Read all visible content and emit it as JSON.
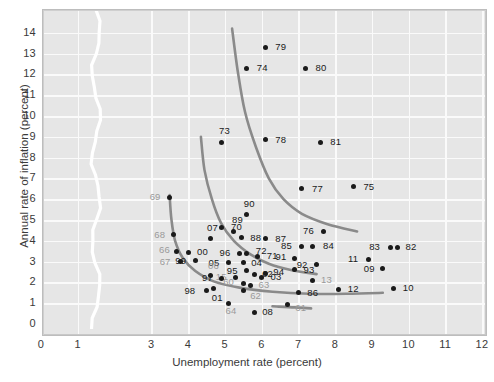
{
  "chart_data": {
    "type": "scatter",
    "title": "",
    "xlabel": "Unemployment rate (percent)",
    "ylabel": "Annual rate of inflation (percent)",
    "xlim": [
      0,
      12
    ],
    "ylim": [
      0,
      14
    ],
    "xticks": [
      0,
      1,
      3,
      4,
      5,
      6,
      7,
      8,
      9,
      10,
      11,
      12
    ],
    "yticks": [
      0,
      1,
      2,
      3,
      4,
      5,
      6,
      7,
      8,
      9,
      10,
      11,
      12,
      13,
      14
    ],
    "axis_break": {
      "between": [
        1,
        3
      ],
      "axis": "x"
    },
    "grid": true,
    "legend": "none",
    "point_color": "#1a1a1a",
    "curve_color": "#8a8a8a",
    "background_color": "#e6e6e6",
    "gridline_color": "#fafafa",
    "points": [
      {
        "label": "79",
        "x": 6.1,
        "y": 13.3,
        "lx": 10,
        "ly": -5,
        "faint": false
      },
      {
        "label": "74",
        "x": 5.6,
        "y": 12.3,
        "lx": 10,
        "ly": -5,
        "faint": false
      },
      {
        "label": "80",
        "x": 7.2,
        "y": 12.3,
        "lx": 10,
        "ly": -5,
        "faint": false
      },
      {
        "label": "73",
        "x": 4.9,
        "y": 8.75,
        "lx": -2,
        "ly": -16,
        "faint": false
      },
      {
        "label": "78",
        "x": 6.1,
        "y": 8.85,
        "lx": 10,
        "ly": -5,
        "faint": false
      },
      {
        "label": "81",
        "x": 7.6,
        "y": 8.75,
        "lx": 10,
        "ly": -5,
        "faint": false
      },
      {
        "label": "77",
        "x": 7.1,
        "y": 6.5,
        "lx": 10,
        "ly": -5,
        "faint": false
      },
      {
        "label": "75",
        "x": 8.5,
        "y": 6.6,
        "lx": 10,
        "ly": -5,
        "faint": false
      },
      {
        "label": "69",
        "x": 3.5,
        "y": 6.1,
        "lx": -20,
        "ly": -5,
        "faint": true
      },
      {
        "label": "90",
        "x": 5.6,
        "y": 5.25,
        "lx": -3,
        "ly": -16,
        "faint": false
      },
      {
        "label": "70",
        "x": 4.9,
        "y": 4.65,
        "lx": 10,
        "ly": -5,
        "faint": false
      },
      {
        "label": "76",
        "x": 7.7,
        "y": 4.45,
        "lx": -21,
        "ly": -5,
        "faint": false
      },
      {
        "label": "68",
        "x": 3.6,
        "y": 4.3,
        "lx": -19,
        "ly": -5,
        "faint": true
      },
      {
        "label": "07",
        "x": 4.6,
        "y": 4.1,
        "lx": -3,
        "ly": -16,
        "faint": false
      },
      {
        "label": "89",
        "x": 5.25,
        "y": 4.45,
        "lx": -2,
        "ly": -16,
        "faint": false
      },
      {
        "label": "88",
        "x": 5.45,
        "y": 4.15,
        "lx": 9,
        "ly": -5,
        "faint": false
      },
      {
        "label": "87",
        "x": 6.1,
        "y": 4.1,
        "lx": 10,
        "ly": -5,
        "faint": false
      },
      {
        "label": "85",
        "x": 7.1,
        "y": 3.75,
        "lx": -21,
        "ly": -5,
        "faint": false
      },
      {
        "label": "84",
        "x": 7.4,
        "y": 3.75,
        "lx": 10,
        "ly": -5,
        "faint": false
      },
      {
        "label": "83",
        "x": 9.5,
        "y": 3.7,
        "lx": -21,
        "ly": -5,
        "faint": false
      },
      {
        "label": "82",
        "x": 9.7,
        "y": 3.7,
        "lx": 8,
        "ly": -5,
        "faint": false
      },
      {
        "label": "66",
        "x": 3.7,
        "y": 3.5,
        "lx": -18,
        "ly": -6,
        "faint": true
      },
      {
        "label": "00",
        "x": 4.0,
        "y": 3.45,
        "lx": 9,
        "ly": -5,
        "faint": false
      },
      {
        "label": "96",
        "x": 5.4,
        "y": 3.4,
        "lx": -20,
        "ly": -5,
        "faint": false
      },
      {
        "label": "72",
        "x": 5.6,
        "y": 3.4,
        "lx": 9,
        "ly": -7,
        "faint": false
      },
      {
        "label": "71",
        "x": 5.9,
        "y": 3.25,
        "lx": 9,
        "ly": -5,
        "faint": false
      },
      {
        "label": "91",
        "x": 6.9,
        "y": 3.15,
        "lx": -19,
        "ly": -6,
        "faint": false
      },
      {
        "label": "11",
        "x": 8.9,
        "y": 3.1,
        "lx": -20,
        "ly": -6,
        "faint": false
      },
      {
        "label": "99",
        "x": 4.2,
        "y": 3.05,
        "lx": -20,
        "ly": -5,
        "faint": false
      },
      {
        "label": "67",
        "x": 3.8,
        "y": 3.0,
        "lx": -21,
        "ly": -5,
        "faint": true
      },
      {
        "label": "05",
        "x": 5.1,
        "y": 2.95,
        "lx": -20,
        "ly": -5,
        "faint": false
      },
      {
        "label": "04",
        "x": 5.5,
        "y": 2.95,
        "lx": 8,
        "ly": -5,
        "faint": false
      },
      {
        "label": "92",
        "x": 7.5,
        "y": 2.85,
        "lx": -20,
        "ly": -5,
        "faint": false
      },
      {
        "label": "09",
        "x": 9.3,
        "y": 2.65,
        "lx": -19,
        "ly": -5,
        "faint": false
      },
      {
        "label": "93",
        "x": 6.9,
        "y": 2.6,
        "lx": 9,
        "ly": -5,
        "faint": false
      },
      {
        "label": "95",
        "x": 5.6,
        "y": 2.55,
        "lx": -20,
        "ly": -5,
        "faint": false
      },
      {
        "label": "02",
        "x": 5.8,
        "y": 2.4,
        "lx": 8,
        "ly": -5,
        "faint": false
      },
      {
        "label": "94",
        "x": 6.1,
        "y": 2.45,
        "lx": 8,
        "ly": -6,
        "faint": false
      },
      {
        "label": "03",
        "x": 6.0,
        "y": 2.25,
        "lx": 9,
        "ly": -5,
        "faint": false
      },
      {
        "label": "15",
        "x": 5.3,
        "y": 2.25,
        "lx": -20,
        "ly": -5,
        "faint": true
      },
      {
        "label": "06",
        "x": 4.6,
        "y": 2.35,
        "lx": -2,
        "ly": -14,
        "faint": true
      },
      {
        "label": "97",
        "x": 4.9,
        "y": 2.2,
        "lx": -19,
        "ly": -5,
        "faint": false
      },
      {
        "label": "13",
        "x": 7.4,
        "y": 2.1,
        "lx": 8,
        "ly": -5,
        "faint": true
      },
      {
        "label": "60",
        "x": 5.5,
        "y": 1.95,
        "lx": -20,
        "ly": -6,
        "faint": true
      },
      {
        "label": "10",
        "x": 9.6,
        "y": 1.7,
        "lx": 9,
        "ly": -6,
        "faint": false
      },
      {
        "label": "63",
        "x": 5.7,
        "y": 1.85,
        "lx": 8,
        "ly": -6,
        "faint": true
      },
      {
        "label": "98",
        "x": 4.5,
        "y": 1.6,
        "lx": -22,
        "ly": -5,
        "faint": false
      },
      {
        "label": "01",
        "x": 4.7,
        "y": 1.7,
        "lx": -2,
        "ly": 4,
        "faint": false
      },
      {
        "label": "62",
        "x": 5.5,
        "y": 1.6,
        "lx": 7,
        "ly": 0,
        "faint": true
      },
      {
        "label": "12",
        "x": 8.1,
        "y": 1.65,
        "lx": 9,
        "ly": -6,
        "faint": false
      },
      {
        "label": "86",
        "x": 7.0,
        "y": 1.5,
        "lx": 9,
        "ly": -5,
        "faint": false
      },
      {
        "label": "64",
        "x": 5.1,
        "y": 1.0,
        "lx": -3,
        "ly": 3,
        "faint": true
      },
      {
        "label": "61",
        "x": 6.7,
        "y": 0.95,
        "lx": 8,
        "ly": -1,
        "faint": true
      },
      {
        "label": "08",
        "x": 5.8,
        "y": 0.55,
        "lx": 8,
        "ly": -6,
        "faint": false
      }
    ],
    "curves": [
      {
        "name": "phillips-curve-1970s",
        "points": [
          [
            5.2,
            14.2
          ],
          [
            5.35,
            12.2
          ],
          [
            5.55,
            10.2
          ],
          [
            5.85,
            8.5
          ],
          [
            6.2,
            7.0
          ],
          [
            6.6,
            6.0
          ],
          [
            7.1,
            5.3
          ],
          [
            7.8,
            4.8
          ],
          [
            8.6,
            4.45
          ]
        ]
      },
      {
        "name": "phillips-curve-1960s-high",
        "points": [
          [
            4.35,
            9.0
          ],
          [
            4.45,
            7.4
          ],
          [
            4.65,
            6.0
          ],
          [
            4.9,
            4.85
          ],
          [
            5.25,
            4.0
          ],
          [
            5.7,
            3.35
          ],
          [
            6.2,
            2.9
          ],
          [
            6.8,
            2.6
          ],
          [
            7.5,
            2.4
          ]
        ]
      },
      {
        "name": "phillips-curve-modern",
        "points": [
          [
            3.5,
            6.2
          ],
          [
            3.55,
            5.0
          ],
          [
            3.65,
            4.0
          ],
          [
            3.85,
            3.2
          ],
          [
            4.2,
            2.55
          ],
          [
            4.7,
            2.05
          ],
          [
            5.4,
            1.75
          ],
          [
            6.3,
            1.55
          ],
          [
            7.3,
            1.45
          ],
          [
            8.3,
            1.45
          ],
          [
            9.3,
            1.5
          ]
        ]
      },
      {
        "name": "phillips-curve-tail",
        "points": [
          [
            6.3,
            0.85
          ],
          [
            6.9,
            0.8
          ],
          [
            7.35,
            0.75
          ]
        ]
      }
    ]
  }
}
